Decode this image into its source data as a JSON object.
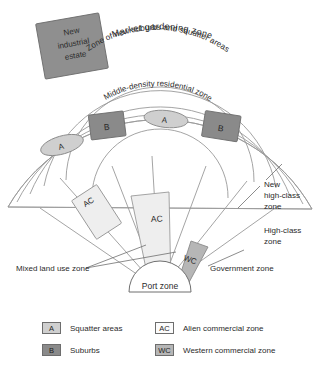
{
  "title": "SOUTHEAST ASIAN CITY",
  "diagram": {
    "type": "urban-land-use-model",
    "center_label": "Port zone",
    "zones": {
      "market_gardening": "Market  gardening  zone",
      "new_suburbs": "Zone of new suburbs and squatter areas",
      "middle_density": "Middle-density residential zone",
      "mixed_land_use": "Mixed land use zone",
      "government": "Government zone",
      "high_class": "High-class zone",
      "new_high_class": "New high-class zone",
      "industrial_estate": "New industrial estate"
    },
    "patch_labels": {
      "squatter": "A",
      "suburbs": "B",
      "alien_commercial": "AC",
      "western_commercial": "WC"
    }
  },
  "legend": {
    "items": [
      {
        "key": "A",
        "label": "Squatter areas",
        "swatch": "light"
      },
      {
        "key": "B",
        "label": "Suburbs",
        "swatch": "dark"
      },
      {
        "key": "AC",
        "label": "Alien commercial zone",
        "swatch": "white"
      },
      {
        "key": "WC",
        "label": "Western commercial zone",
        "swatch": "mid"
      }
    ]
  },
  "colors": {
    "outline": "#9a9a9a",
    "squatter_fill": "#cfcfcf",
    "suburb_fill": "#8a8a8a",
    "alien_fill": "#eeeeee",
    "western_fill": "#b6b6b6",
    "industrial_fill": "#8f8f8f",
    "text": "#2b2b2b"
  }
}
